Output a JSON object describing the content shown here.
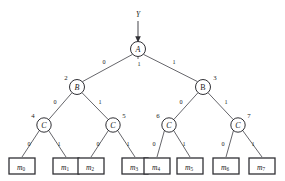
{
  "diagram": {
    "input": {
      "label": "Y"
    },
    "colors": {
      "stroke": "#303035",
      "edge": "#55555a",
      "background": "#ffffff",
      "text": "#1a1a1a"
    },
    "nodes": [
      {
        "id": "A",
        "label": "A",
        "index": "",
        "index_side": "none",
        "x": 138,
        "y": 49,
        "r": 7.5
      },
      {
        "id": "B_left",
        "label": "B",
        "index": "2",
        "index_side": "left",
        "x": 77,
        "y": 87,
        "r": 7.5
      },
      {
        "id": "B_right",
        "label": "B",
        "index": "3",
        "index_side": "right",
        "x": 203,
        "y": 87,
        "r": 7.5
      },
      {
        "id": "C_0",
        "label": "C",
        "index": "4",
        "index_side": "left",
        "x": 44,
        "y": 125,
        "r": 7.2
      },
      {
        "id": "C_1",
        "label": "C",
        "index": "5",
        "index_side": "right",
        "x": 113,
        "y": 125,
        "r": 7.2
      },
      {
        "id": "C_2",
        "label": "C",
        "index": "6",
        "index_side": "left",
        "x": 169,
        "y": 125,
        "r": 7.2
      },
      {
        "id": "C_3",
        "label": "C",
        "index": "7",
        "index_side": "right",
        "x": 238,
        "y": 125,
        "r": 7.2
      }
    ],
    "edges": [
      {
        "from": "A",
        "to": "B_left",
        "label": "0",
        "lx": 104,
        "ly": 61
      },
      {
        "from": "A",
        "to": "B_right",
        "label": "1",
        "lx": 174,
        "ly": 61
      },
      {
        "from": "A",
        "to": "center",
        "label": "1",
        "lx": 139,
        "ly": 62
      },
      {
        "from": "B_left",
        "to": "C_0",
        "label": "0",
        "lx": 55,
        "ly": 101
      },
      {
        "from": "B_left",
        "to": "C_1",
        "label": "1",
        "lx": 100,
        "ly": 101
      },
      {
        "from": "B_right",
        "to": "C_2",
        "label": "0",
        "lx": 181,
        "ly": 101
      },
      {
        "from": "B_right",
        "to": "C_3",
        "label": "1",
        "lx": 226,
        "ly": 101
      },
      {
        "from": "C_0",
        "to": "m0",
        "label": "0",
        "lx": 29,
        "ly": 143
      },
      {
        "from": "C_0",
        "to": "m1",
        "label": "1",
        "lx": 59,
        "ly": 143
      },
      {
        "from": "C_1",
        "to": "m2",
        "label": "0",
        "lx": 98,
        "ly": 143
      },
      {
        "from": "C_1",
        "to": "m3",
        "label": "1",
        "lx": 128,
        "ly": 143
      },
      {
        "from": "C_2",
        "to": "m4",
        "label": "0",
        "lx": 154,
        "ly": 143
      },
      {
        "from": "C_2",
        "to": "m5",
        "label": "1",
        "lx": 184,
        "ly": 143
      },
      {
        "from": "C_3",
        "to": "m6",
        "label": "0",
        "lx": 223,
        "ly": 143
      },
      {
        "from": "C_3",
        "to": "m7",
        "label": "1",
        "lx": 253,
        "ly": 143
      }
    ],
    "leaves": [
      {
        "id": "m0",
        "base": "m",
        "sub": "0",
        "x": 22,
        "y": 167
      },
      {
        "id": "m1",
        "base": "m",
        "sub": "1",
        "x": 66,
        "y": 167
      },
      {
        "id": "m2",
        "base": "m",
        "sub": "2",
        "x": 91,
        "y": 167
      },
      {
        "id": "m3",
        "base": "m",
        "sub": "3",
        "x": 135,
        "y": 167
      },
      {
        "id": "m4",
        "base": "m",
        "sub": "4",
        "x": 157,
        "y": 167
      },
      {
        "id": "m5",
        "base": "m",
        "sub": "5",
        "x": 190,
        "y": 167
      },
      {
        "id": "m6",
        "base": "m",
        "sub": "6",
        "x": 226,
        "y": 167
      },
      {
        "id": "m7",
        "base": "m",
        "sub": "7",
        "x": 262,
        "y": 167
      }
    ]
  }
}
